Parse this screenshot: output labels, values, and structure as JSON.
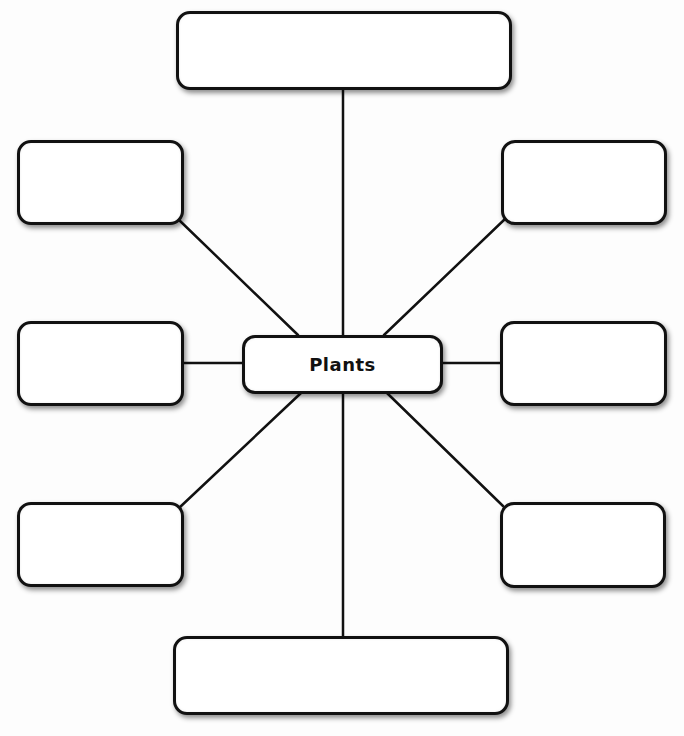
{
  "diagram": {
    "type": "concept-map",
    "center": {
      "label": "Plants"
    },
    "nodes": [
      {
        "id": "top",
        "label": ""
      },
      {
        "id": "upper-left",
        "label": ""
      },
      {
        "id": "upper-right",
        "label": ""
      },
      {
        "id": "middle-left",
        "label": ""
      },
      {
        "id": "middle-right",
        "label": ""
      },
      {
        "id": "lower-left",
        "label": ""
      },
      {
        "id": "lower-right",
        "label": ""
      },
      {
        "id": "bottom",
        "label": ""
      }
    ],
    "colors": {
      "stroke": "#111111",
      "fill": "#ffffff",
      "background": "#fdfdfd"
    }
  }
}
